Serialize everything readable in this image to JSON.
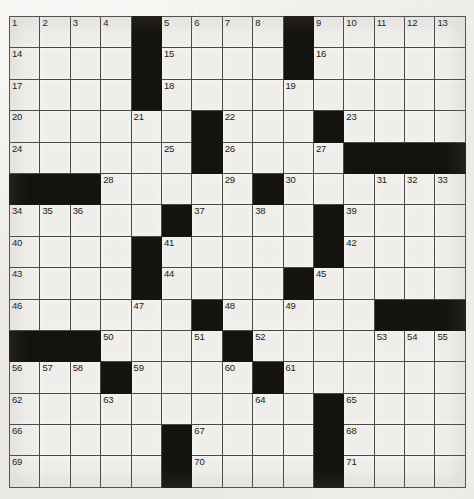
{
  "puzzle": {
    "kind": "crossword-grid",
    "rows": 15,
    "columns": 15,
    "colors": {
      "paper": "#efeeea",
      "block": "#15130f",
      "rule": "#4a4a48",
      "number": "#1b1a18"
    },
    "counts": {
      "total_cells": 225,
      "block_cells": 61,
      "open_cells": 164,
      "highest_number": 71
    },
    "grid": [
      [
        {
          "t": "open",
          "n": "1"
        },
        {
          "t": "open",
          "n": "2"
        },
        {
          "t": "open",
          "n": "3"
        },
        {
          "t": "open",
          "n": "4"
        },
        {
          "t": "block",
          "n": ""
        },
        {
          "t": "open",
          "n": "5"
        },
        {
          "t": "open",
          "n": "6"
        },
        {
          "t": "open",
          "n": "7"
        },
        {
          "t": "open",
          "n": "8"
        },
        {
          "t": "block",
          "n": ""
        },
        {
          "t": "open",
          "n": "9"
        },
        {
          "t": "open",
          "n": "10"
        },
        {
          "t": "open",
          "n": "11"
        },
        {
          "t": "open",
          "n": "12"
        },
        {
          "t": "open",
          "n": "13"
        }
      ],
      [
        {
          "t": "open",
          "n": "14"
        },
        {
          "t": "open",
          "n": ""
        },
        {
          "t": "open",
          "n": ""
        },
        {
          "t": "open",
          "n": ""
        },
        {
          "t": "block",
          "n": ""
        },
        {
          "t": "open",
          "n": "15"
        },
        {
          "t": "open",
          "n": ""
        },
        {
          "t": "open",
          "n": ""
        },
        {
          "t": "open",
          "n": ""
        },
        {
          "t": "block",
          "n": ""
        },
        {
          "t": "open",
          "n": "16"
        },
        {
          "t": "open",
          "n": ""
        },
        {
          "t": "open",
          "n": ""
        },
        {
          "t": "open",
          "n": ""
        },
        {
          "t": "open",
          "n": ""
        }
      ],
      [
        {
          "t": "open",
          "n": "17"
        },
        {
          "t": "open",
          "n": ""
        },
        {
          "t": "open",
          "n": ""
        },
        {
          "t": "open",
          "n": ""
        },
        {
          "t": "block",
          "n": ""
        },
        {
          "t": "open",
          "n": "18"
        },
        {
          "t": "open",
          "n": ""
        },
        {
          "t": "open",
          "n": ""
        },
        {
          "t": "open",
          "n": ""
        },
        {
          "t": "open",
          "n": "19"
        },
        {
          "t": "open",
          "n": ""
        },
        {
          "t": "open",
          "n": ""
        },
        {
          "t": "open",
          "n": ""
        },
        {
          "t": "open",
          "n": ""
        },
        {
          "t": "open",
          "n": ""
        }
      ],
      [
        {
          "t": "open",
          "n": "20"
        },
        {
          "t": "open",
          "n": ""
        },
        {
          "t": "open",
          "n": ""
        },
        {
          "t": "open",
          "n": ""
        },
        {
          "t": "open",
          "n": "21"
        },
        {
          "t": "open",
          "n": ""
        },
        {
          "t": "block",
          "n": ""
        },
        {
          "t": "open",
          "n": "22"
        },
        {
          "t": "open",
          "n": ""
        },
        {
          "t": "open",
          "n": ""
        },
        {
          "t": "block",
          "n": ""
        },
        {
          "t": "open",
          "n": "23"
        },
        {
          "t": "open",
          "n": ""
        },
        {
          "t": "open",
          "n": ""
        },
        {
          "t": "open",
          "n": ""
        }
      ],
      [
        {
          "t": "open",
          "n": "24"
        },
        {
          "t": "open",
          "n": ""
        },
        {
          "t": "open",
          "n": ""
        },
        {
          "t": "open",
          "n": ""
        },
        {
          "t": "open",
          "n": ""
        },
        {
          "t": "open",
          "n": "25"
        },
        {
          "t": "block",
          "n": ""
        },
        {
          "t": "open",
          "n": "26"
        },
        {
          "t": "open",
          "n": ""
        },
        {
          "t": "open",
          "n": ""
        },
        {
          "t": "open",
          "n": "27"
        },
        {
          "t": "block",
          "n": ""
        },
        {
          "t": "block",
          "n": ""
        },
        {
          "t": "block",
          "n": ""
        },
        {
          "t": "block",
          "n": ""
        }
      ],
      [
        {
          "t": "block",
          "n": ""
        },
        {
          "t": "block",
          "n": ""
        },
        {
          "t": "block",
          "n": ""
        },
        {
          "t": "open",
          "n": "28"
        },
        {
          "t": "open",
          "n": ""
        },
        {
          "t": "open",
          "n": ""
        },
        {
          "t": "open",
          "n": ""
        },
        {
          "t": "open",
          "n": "29"
        },
        {
          "t": "block",
          "n": ""
        },
        {
          "t": "open",
          "n": "30"
        },
        {
          "t": "open",
          "n": ""
        },
        {
          "t": "open",
          "n": ""
        },
        {
          "t": "open",
          "n": "31"
        },
        {
          "t": "open",
          "n": "32"
        },
        {
          "t": "open",
          "n": "33"
        }
      ],
      [
        {
          "t": "open",
          "n": "34"
        },
        {
          "t": "open",
          "n": "35"
        },
        {
          "t": "open",
          "n": "36"
        },
        {
          "t": "open",
          "n": ""
        },
        {
          "t": "open",
          "n": ""
        },
        {
          "t": "block",
          "n": ""
        },
        {
          "t": "open",
          "n": "37"
        },
        {
          "t": "open",
          "n": ""
        },
        {
          "t": "open",
          "n": "38"
        },
        {
          "t": "open",
          "n": ""
        },
        {
          "t": "block",
          "n": ""
        },
        {
          "t": "open",
          "n": "39"
        },
        {
          "t": "open",
          "n": ""
        },
        {
          "t": "open",
          "n": ""
        },
        {
          "t": "open",
          "n": ""
        }
      ],
      [
        {
          "t": "open",
          "n": "40"
        },
        {
          "t": "open",
          "n": ""
        },
        {
          "t": "open",
          "n": ""
        },
        {
          "t": "open",
          "n": ""
        },
        {
          "t": "block",
          "n": ""
        },
        {
          "t": "open",
          "n": "41"
        },
        {
          "t": "open",
          "n": ""
        },
        {
          "t": "open",
          "n": ""
        },
        {
          "t": "open",
          "n": ""
        },
        {
          "t": "open",
          "n": ""
        },
        {
          "t": "block",
          "n": ""
        },
        {
          "t": "open",
          "n": "42"
        },
        {
          "t": "open",
          "n": ""
        },
        {
          "t": "open",
          "n": ""
        },
        {
          "t": "open",
          "n": ""
        }
      ],
      [
        {
          "t": "open",
          "n": "43"
        },
        {
          "t": "open",
          "n": ""
        },
        {
          "t": "open",
          "n": ""
        },
        {
          "t": "open",
          "n": ""
        },
        {
          "t": "block",
          "n": ""
        },
        {
          "t": "open",
          "n": "44"
        },
        {
          "t": "open",
          "n": ""
        },
        {
          "t": "open",
          "n": ""
        },
        {
          "t": "open",
          "n": ""
        },
        {
          "t": "block",
          "n": ""
        },
        {
          "t": "open",
          "n": "45"
        },
        {
          "t": "open",
          "n": ""
        },
        {
          "t": "open",
          "n": ""
        },
        {
          "t": "open",
          "n": ""
        },
        {
          "t": "open",
          "n": ""
        }
      ],
      [
        {
          "t": "open",
          "n": "46"
        },
        {
          "t": "open",
          "n": ""
        },
        {
          "t": "open",
          "n": ""
        },
        {
          "t": "open",
          "n": ""
        },
        {
          "t": "open",
          "n": "47"
        },
        {
          "t": "open",
          "n": ""
        },
        {
          "t": "block",
          "n": ""
        },
        {
          "t": "open",
          "n": "48"
        },
        {
          "t": "open",
          "n": ""
        },
        {
          "t": "open",
          "n": "49"
        },
        {
          "t": "open",
          "n": ""
        },
        {
          "t": "open",
          "n": ""
        },
        {
          "t": "block",
          "n": ""
        },
        {
          "t": "block",
          "n": ""
        },
        {
          "t": "block",
          "n": ""
        }
      ],
      [
        {
          "t": "block",
          "n": ""
        },
        {
          "t": "block",
          "n": ""
        },
        {
          "t": "block",
          "n": ""
        },
        {
          "t": "open",
          "n": "50"
        },
        {
          "t": "open",
          "n": ""
        },
        {
          "t": "open",
          "n": ""
        },
        {
          "t": "open",
          "n": "51"
        },
        {
          "t": "block",
          "n": ""
        },
        {
          "t": "open",
          "n": "52"
        },
        {
          "t": "open",
          "n": ""
        },
        {
          "t": "open",
          "n": ""
        },
        {
          "t": "open",
          "n": ""
        },
        {
          "t": "open",
          "n": "53"
        },
        {
          "t": "open",
          "n": "54"
        },
        {
          "t": "open",
          "n": "55"
        }
      ],
      [
        {
          "t": "open",
          "n": "56"
        },
        {
          "t": "open",
          "n": "57"
        },
        {
          "t": "open",
          "n": "58"
        },
        {
          "t": "block",
          "n": ""
        },
        {
          "t": "open",
          "n": "59"
        },
        {
          "t": "open",
          "n": ""
        },
        {
          "t": "open",
          "n": ""
        },
        {
          "t": "open",
          "n": "60"
        },
        {
          "t": "block",
          "n": ""
        },
        {
          "t": "open",
          "n": "61"
        },
        {
          "t": "open",
          "n": ""
        },
        {
          "t": "open",
          "n": ""
        },
        {
          "t": "open",
          "n": ""
        },
        {
          "t": "open",
          "n": ""
        },
        {
          "t": "open",
          "n": ""
        }
      ],
      [
        {
          "t": "open",
          "n": "62"
        },
        {
          "t": "open",
          "n": ""
        },
        {
          "t": "open",
          "n": ""
        },
        {
          "t": "open",
          "n": "63"
        },
        {
          "t": "open",
          "n": ""
        },
        {
          "t": "open",
          "n": ""
        },
        {
          "t": "open",
          "n": ""
        },
        {
          "t": "open",
          "n": ""
        },
        {
          "t": "open",
          "n": "64"
        },
        {
          "t": "open",
          "n": ""
        },
        {
          "t": "block",
          "n": ""
        },
        {
          "t": "open",
          "n": "65"
        },
        {
          "t": "open",
          "n": ""
        },
        {
          "t": "open",
          "n": ""
        },
        {
          "t": "open",
          "n": ""
        }
      ],
      [
        {
          "t": "open",
          "n": "66"
        },
        {
          "t": "open",
          "n": ""
        },
        {
          "t": "open",
          "n": ""
        },
        {
          "t": "open",
          "n": ""
        },
        {
          "t": "open",
          "n": ""
        },
        {
          "t": "block",
          "n": ""
        },
        {
          "t": "open",
          "n": "67"
        },
        {
          "t": "open",
          "n": ""
        },
        {
          "t": "open",
          "n": ""
        },
        {
          "t": "open",
          "n": ""
        },
        {
          "t": "block",
          "n": ""
        },
        {
          "t": "open",
          "n": "68"
        },
        {
          "t": "open",
          "n": ""
        },
        {
          "t": "open",
          "n": ""
        },
        {
          "t": "open",
          "n": ""
        }
      ],
      [
        {
          "t": "open",
          "n": "69"
        },
        {
          "t": "open",
          "n": ""
        },
        {
          "t": "open",
          "n": ""
        },
        {
          "t": "open",
          "n": ""
        },
        {
          "t": "open",
          "n": ""
        },
        {
          "t": "block",
          "n": ""
        },
        {
          "t": "open",
          "n": "70"
        },
        {
          "t": "open",
          "n": ""
        },
        {
          "t": "open",
          "n": ""
        },
        {
          "t": "open",
          "n": ""
        },
        {
          "t": "block",
          "n": ""
        },
        {
          "t": "open",
          "n": "71"
        },
        {
          "t": "open",
          "n": ""
        },
        {
          "t": "open",
          "n": ""
        },
        {
          "t": "open",
          "n": ""
        }
      ]
    ]
  }
}
